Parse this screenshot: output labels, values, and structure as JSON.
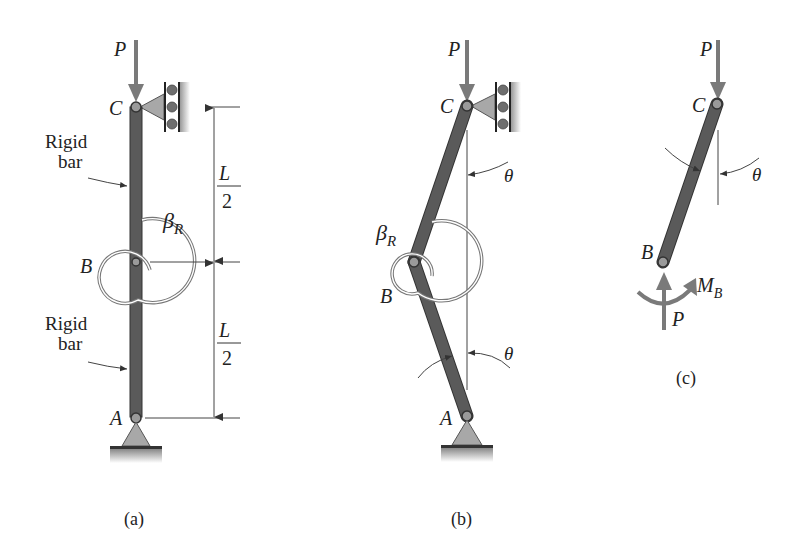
{
  "figure": {
    "panels": [
      {
        "id": "a",
        "caption": "(a)",
        "load_label": "P",
        "joint_labels": {
          "top": "C",
          "middle": "B",
          "bottom": "A"
        },
        "spring_label": "β",
        "spring_subscript": "R",
        "bar_label_line1": "Rigid",
        "bar_label_line2": "bar",
        "dimension_numerator": "L",
        "dimension_denominator": "2"
      },
      {
        "id": "b",
        "caption": "(b)",
        "load_label": "P",
        "joint_labels": {
          "top": "C",
          "middle": "B",
          "bottom": "A"
        },
        "spring_label": "β",
        "spring_subscript": "R",
        "angle_label": "θ"
      },
      {
        "id": "c",
        "caption": "(c)",
        "load_label_top": "P",
        "load_label_bottom": "P",
        "joint_labels": {
          "top": "C",
          "bottom": "B"
        },
        "angle_label": "θ",
        "moment_label": "M",
        "moment_subscript": "B"
      }
    ]
  }
}
